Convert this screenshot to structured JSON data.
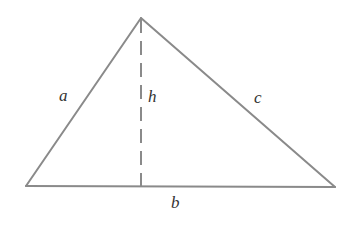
{
  "figure": {
    "kind": "geometry-diagram",
    "shape": "triangle-with-altitude",
    "background_color": "#ffffff",
    "stroke_color": "#8a8a8a",
    "label_color": "#333333",
    "stroke_width": 2,
    "dash_pattern": "14 8",
    "canvas": {
      "width": 345,
      "height": 231
    },
    "vertices": {
      "left": {
        "x": 26,
        "y": 186
      },
      "apex": {
        "x": 141,
        "y": 18
      },
      "right": {
        "x": 335,
        "y": 187
      }
    },
    "altitude": {
      "from": {
        "x": 141,
        "y": 18
      },
      "to": {
        "x": 141,
        "y": 187
      },
      "style": "dashed"
    },
    "labels": {
      "left_side": "a",
      "altitude": "h",
      "right_side": "c",
      "base": "b"
    }
  }
}
